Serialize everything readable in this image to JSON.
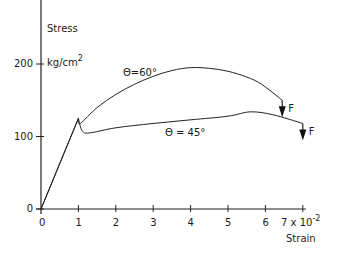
{
  "chart_data": {
    "type": "line",
    "title": "",
    "xlabel": "Strain",
    "xlabel_multiplier": "7 x 10",
    "xlabel_exponent": "-2",
    "ylabel": "Stress",
    "ylabel_units": "kg/cm",
    "ylabel_units_exp": "2",
    "xlim": [
      0,
      7
    ],
    "ylim": [
      0,
      250
    ],
    "grid": false,
    "x_ticks": [
      "0",
      "1",
      "2",
      "3",
      "4",
      "5",
      "6"
    ],
    "y_ticks": [
      "0",
      "100",
      "200"
    ],
    "series": [
      {
        "name": "θ=60°",
        "label": "Θ=60°",
        "x": [
          0,
          1.0,
          1.05,
          1.5,
          2.0,
          2.5,
          3.0,
          3.5,
          4.0,
          4.5,
          5.0,
          5.5,
          5.9,
          6.45
        ],
        "y": [
          0,
          125,
          118,
          140,
          158,
          172,
          183,
          191,
          195,
          194,
          190,
          182,
          172,
          150
        ],
        "end_marker": "F"
      },
      {
        "name": "θ=45°",
        "label": "Θ = 45°",
        "x": [
          0,
          1.0,
          1.1,
          1.3,
          2.0,
          3.0,
          4.0,
          5.0,
          5.6,
          6.2,
          7.0
        ],
        "y": [
          0,
          125,
          108,
          105,
          112,
          118,
          123,
          128,
          134,
          130,
          118
        ],
        "end_marker": "F"
      }
    ],
    "annotations": [
      "Θ=60°",
      "Θ = 45°",
      "F",
      "F"
    ]
  }
}
